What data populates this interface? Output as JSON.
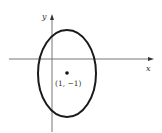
{
  "diagram": {
    "type": "ellipse-on-axes",
    "axes": {
      "x_label": "x",
      "y_label": "y"
    },
    "ellipse": {
      "center_label": "(1, −1)",
      "center": [
        1,
        -1
      ]
    }
  }
}
